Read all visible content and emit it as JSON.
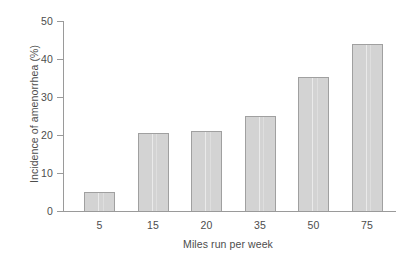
{
  "chart_data": {
    "type": "bar",
    "title": "",
    "xlabel": "Miles run per week",
    "ylabel": "Incidence of amenorrhea (%)",
    "categories": [
      "5",
      "15",
      "20",
      "35",
      "50",
      "75"
    ],
    "values": [
      5,
      20.6,
      21,
      25,
      35.3,
      44
    ],
    "ylim": [
      0,
      50
    ],
    "yticks": [
      "0",
      "10",
      "20",
      "30",
      "40",
      "50"
    ],
    "ytick_values": [
      0,
      10,
      20,
      30,
      40,
      50
    ],
    "grid": false,
    "legend": null,
    "bar_color": "#d3d3d3",
    "bar_edge_color": "#a0a0a0",
    "axis_color": "#9a9a9a",
    "text_color": "#4d4d4d"
  }
}
